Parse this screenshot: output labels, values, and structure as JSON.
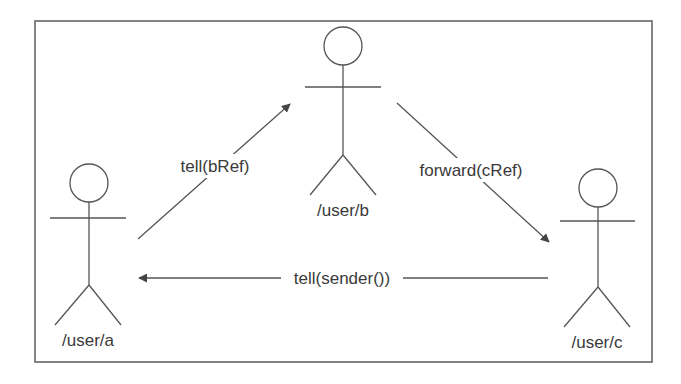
{
  "diagram": {
    "type": "actor-message-flow",
    "actors": [
      {
        "id": "a",
        "label": "/user/a"
      },
      {
        "id": "b",
        "label": "/user/b"
      },
      {
        "id": "c",
        "label": "/user/c"
      }
    ],
    "messages": [
      {
        "from": "a",
        "to": "b",
        "label": "tell(bRef)"
      },
      {
        "from": "b",
        "to": "c",
        "label": "forward(cRef)"
      },
      {
        "from": "c",
        "to": "a",
        "label": "tell(sender())"
      }
    ],
    "colors": {
      "line": "#555555",
      "text": "#3a3a3a",
      "frame": "#666666"
    }
  }
}
